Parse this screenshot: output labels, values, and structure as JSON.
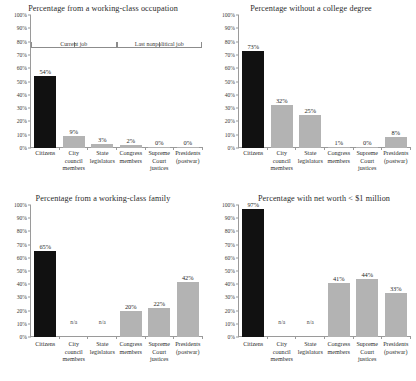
{
  "figure": {
    "categories": [
      "Citizens",
      "City council members",
      "State legislators",
      "Congress members",
      "Supreme Court justices",
      "Presidents (postwar)"
    ],
    "y_ticks": [
      "0%",
      "10%",
      "20%",
      "30%",
      "40%",
      "50%",
      "60%",
      "70%",
      "80%",
      "90%",
      "100%"
    ],
    "colors": {
      "highlight": "#111111",
      "series": "#b3b3b3",
      "axis": "#9a9a9a",
      "text": "#2b2b2b"
    }
  },
  "chart_data": [
    {
      "type": "bar",
      "title": "Percentage from a working-class occupation",
      "categories": [
        "Citizens",
        "City council members",
        "State legislators",
        "Congress members",
        "Supreme Court justices",
        "Presidents (postwar)"
      ],
      "values": [
        54,
        9,
        3,
        2,
        0,
        0
      ],
      "labels": [
        "54%",
        "9%",
        "3%",
        "2%",
        "0%",
        "0%"
      ],
      "bar_colors": [
        "#111111",
        "#b3b3b3",
        "#b3b3b3",
        "#b3b3b3",
        "#b3b3b3",
        "#b3b3b3"
      ],
      "xlabel": "",
      "ylabel": "",
      "ylim": [
        0,
        100
      ],
      "ytick_labels": [
        "0%",
        "10%",
        "20%",
        "30%",
        "40%",
        "50%",
        "60%",
        "70%",
        "80%",
        "90%",
        "100%"
      ],
      "grid": false,
      "legend": "none",
      "annotations": [
        {
          "text": "Current job",
          "spans": [
            0,
            2
          ]
        },
        {
          "text": "Last nonpolitical job",
          "spans": [
            3,
            5
          ]
        }
      ]
    },
    {
      "type": "bar",
      "title": "Percentage without a college degree",
      "categories": [
        "Citizens",
        "City council members",
        "State legislators",
        "Congress members",
        "Supreme Court justices",
        "Presidents (postwar)"
      ],
      "values": [
        73,
        32,
        25,
        1,
        0,
        8
      ],
      "labels": [
        "73%",
        "32%",
        "25%",
        "1%",
        "0%",
        "8%"
      ],
      "bar_colors": [
        "#111111",
        "#b3b3b3",
        "#b3b3b3",
        "#b3b3b3",
        "#b3b3b3",
        "#b3b3b3"
      ],
      "xlabel": "",
      "ylabel": "",
      "ylim": [
        0,
        100
      ],
      "ytick_labels": [
        "0%",
        "10%",
        "20%",
        "30%",
        "40%",
        "50%",
        "60%",
        "70%",
        "80%",
        "90%",
        "100%"
      ],
      "grid": false,
      "legend": "none",
      "annotations": []
    },
    {
      "type": "bar",
      "title": "Percentage from a working-class family",
      "categories": [
        "Citizens",
        "City council members",
        "State legislators",
        "Congress members",
        "Supreme Court justices",
        "Presidents (postwar)"
      ],
      "values": [
        65,
        null,
        null,
        20,
        22,
        42
      ],
      "labels": [
        "65%",
        "n/a",
        "n/a",
        "20%",
        "22%",
        "42%"
      ],
      "bar_colors": [
        "#111111",
        null,
        null,
        "#b3b3b3",
        "#b3b3b3",
        "#b3b3b3"
      ],
      "xlabel": "",
      "ylabel": "",
      "ylim": [
        0,
        100
      ],
      "ytick_labels": [
        "0%",
        "10%",
        "20%",
        "30%",
        "40%",
        "50%",
        "60%",
        "70%",
        "80%",
        "90%",
        "100%"
      ],
      "grid": false,
      "legend": "none",
      "annotations": []
    },
    {
      "type": "bar",
      "title": "Percentage with  net worth < $1 million",
      "categories": [
        "Citizens",
        "City council members",
        "State legislators",
        "Congress members",
        "Supreme Court justices",
        "Presidents (postwar)"
      ],
      "values": [
        97,
        null,
        null,
        41,
        44,
        33
      ],
      "labels": [
        "97%",
        "n/a",
        "n/a",
        "41%",
        "44%",
        "33%"
      ],
      "bar_colors": [
        "#111111",
        null,
        null,
        "#b3b3b3",
        "#b3b3b3",
        "#b3b3b3"
      ],
      "xlabel": "",
      "ylabel": "",
      "ylim": [
        0,
        100
      ],
      "ytick_labels": [
        "0%",
        "10%",
        "20%",
        "30%",
        "40%",
        "50%",
        "60%",
        "70%",
        "80%",
        "90%",
        "100%"
      ],
      "grid": false,
      "legend": "none",
      "annotations": []
    }
  ]
}
